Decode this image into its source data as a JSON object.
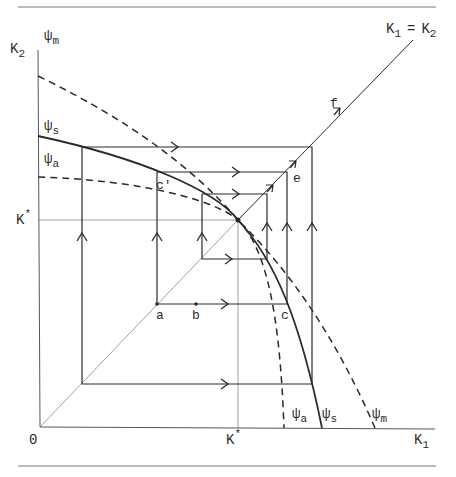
{
  "diagram": {
    "type": "phase-diagram",
    "axes": {
      "origin_label": "0",
      "x_label": "K",
      "x_sub": "1",
      "y_label": "K",
      "y_sub": "2",
      "kstar_x_label": "K",
      "kstar_y_label": "K",
      "kstar_sup": "*"
    },
    "diagonal_label": {
      "k1": "K",
      "k1_sub": "1",
      "eq": "=",
      "k2": "K",
      "k2_sub": "2"
    },
    "curves": [
      {
        "id": "psi_m",
        "symbol": "ψ",
        "sub": "m",
        "style": "dashed"
      },
      {
        "id": "psi_s",
        "symbol": "ψ",
        "sub": "s",
        "style": "solid"
      },
      {
        "id": "psi_a",
        "symbol": "ψ",
        "sub": "a",
        "style": "dashed"
      }
    ],
    "points": {
      "a": "a",
      "b": "b",
      "c": "c",
      "c_prime": "c'",
      "e": "e",
      "f": "f"
    },
    "colors": {
      "ink": "#2a2a2a",
      "light": "#777777",
      "background": "#ffffff"
    }
  }
}
